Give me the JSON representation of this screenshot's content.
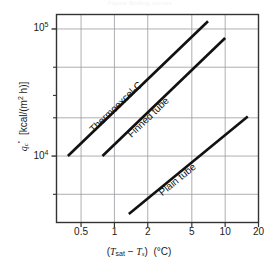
{
  "figure": {
    "caption_remnant": "Figure  Boiling curves"
  },
  "chart_data": {
    "type": "line",
    "title": "",
    "subtitle": "",
    "xlabel": "(Tsat − Ts)  (°C)",
    "xlabel_parts": {
      "open_paren": "(",
      "t_sym": "T",
      "sat_sub": "sat",
      "minus": " − ",
      "t_sym2": "T",
      "s_sub": "s",
      "close_paren": ")",
      "units": "(°C)"
    },
    "ylabel": "q''c  [kcal/(m2 h)]",
    "ylabel_parts": {
      "q_sym": "q",
      "c_sub": "c",
      "dprime": "″",
      "bracket_open": "[kcal/(m",
      "exp2": "2",
      "bracket_close": " h)]"
    },
    "xscale": "log",
    "yscale": "log",
    "xlim": [
      0.3,
      20
    ],
    "ylim": [
      3000,
      130000
    ],
    "grid": true,
    "grid_color": "#9a9aa0",
    "axis_color": "#333333",
    "legend": "inline-labels",
    "legend_position": "along-curves",
    "xticks": [
      {
        "value": 0.5,
        "label": "0.5"
      },
      {
        "value": 1,
        "label": "1"
      },
      {
        "value": 2,
        "label": "2"
      },
      {
        "value": 5,
        "label": "5"
      },
      {
        "value": 10,
        "label": "10"
      },
      {
        "value": 20,
        "label": "20"
      }
    ],
    "yticks": [
      {
        "value": 100000,
        "label": "105",
        "mantissa": "10",
        "exponent": "5",
        "major": true
      },
      {
        "value": 10000,
        "label": "104",
        "mantissa": "10",
        "exponent": "4",
        "major": true
      }
    ],
    "yminorticks": [
      50000,
      30000,
      20000,
      5000
    ],
    "series": [
      {
        "name": "Thermoexcel-C",
        "label": "Thermoexcel-C",
        "color": "#111111",
        "width": 2.6,
        "points": [
          [
            0.38,
            10000
          ],
          [
            7.0,
            115000
          ]
        ],
        "x": [
          0.38,
          7.0
        ],
        "values": [
          10000,
          115000
        ],
        "label_anchor": [
          0.62,
          17500
        ]
      },
      {
        "name": "Finned tube",
        "label": "Finned tube",
        "color": "#111111",
        "width": 2.6,
        "points": [
          [
            0.78,
            10000
          ],
          [
            10.0,
            85000
          ]
        ],
        "x": [
          0.78,
          10.0
        ],
        "values": [
          10000,
          85000
        ],
        "label_anchor": [
          1.35,
          16000
        ]
      },
      {
        "name": "Plain tube",
        "label": "Plain tube",
        "color": "#111111",
        "width": 2.6,
        "points": [
          [
            1.35,
            3500
          ],
          [
            16.0,
            20500
          ]
        ],
        "x": [
          1.35,
          16.0
        ],
        "values": [
          3500,
          20500
        ],
        "label_anchor": [
          2.6,
          5600
        ]
      }
    ]
  }
}
